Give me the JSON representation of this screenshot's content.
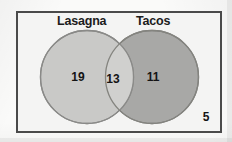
{
  "diagram": {
    "type": "venn",
    "title": "",
    "universe": {
      "name": "universe-rectangle",
      "outside_count": "5"
    },
    "sets": [
      {
        "id": "lasagna",
        "label": "Lasagna",
        "only_count": "19",
        "fill_color": "#c6c6c4",
        "stroke_color": "#8a8a88"
      },
      {
        "id": "tacos",
        "label": "Tacos",
        "only_count": "11",
        "fill_color": "#a8a8a6",
        "stroke_color": "#7e7e7c"
      }
    ],
    "intersection": {
      "label": "Lasagna and Tacos",
      "count": "13",
      "fill_color": "#d0d0ce"
    },
    "frame_color": "#4a4a4a",
    "background_color": "#f4f4f3"
  }
}
